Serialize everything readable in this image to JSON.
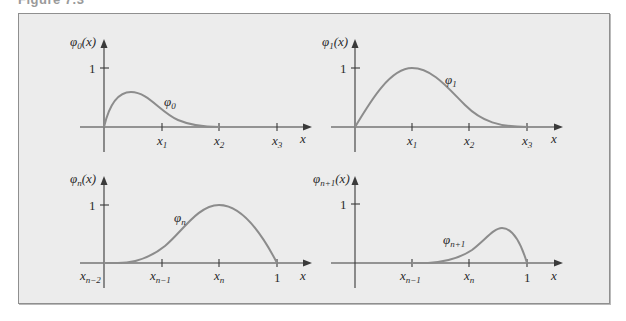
{
  "figure": {
    "caption_fragment": "Figure 7.3",
    "background": "#ececec",
    "curve_color": "#8c8c8c",
    "axis_color": "#3a3a3a"
  },
  "panels": [
    {
      "id": "phi0",
      "ylabel": "φ",
      "ylabel_sub": "0",
      "ylabel_arg": "(x)",
      "y_tick": "1",
      "curve_label": "φ",
      "curve_label_sub": "0",
      "xlabel": "x",
      "x_ticks": [
        {
          "base": "x",
          "sub": "1"
        },
        {
          "base": "x",
          "sub": "2"
        },
        {
          "base": "x",
          "sub": "3"
        }
      ],
      "origin_label": null
    },
    {
      "id": "phi1",
      "ylabel": "φ",
      "ylabel_sub": "1",
      "ylabel_arg": "(x)",
      "y_tick": "1",
      "curve_label": "φ",
      "curve_label_sub": "1",
      "xlabel": "x",
      "x_ticks": [
        {
          "base": "x",
          "sub": "1"
        },
        {
          "base": "x",
          "sub": "2"
        },
        {
          "base": "x",
          "sub": "3"
        }
      ],
      "origin_label": null
    },
    {
      "id": "phin",
      "ylabel": "φ",
      "ylabel_sub": "n",
      "ylabel_arg": "(x)",
      "y_tick": "1",
      "curve_label": "φ",
      "curve_label_sub": "n",
      "xlabel": "x",
      "x_ticks": [
        {
          "base": "x",
          "sub": "n−1"
        },
        {
          "base": "x",
          "sub": "n"
        },
        {
          "base": "1",
          "sub": ""
        }
      ],
      "origin_label": {
        "base": "x",
        "sub": "n−2"
      }
    },
    {
      "id": "phin1",
      "ylabel": "φ",
      "ylabel_sub": "n+1",
      "ylabel_arg": "(x)",
      "y_tick": "1",
      "curve_label": "φ",
      "curve_label_sub": "n+1",
      "xlabel": "x",
      "x_ticks": [
        {
          "base": "x",
          "sub": "n−1"
        },
        {
          "base": "x",
          "sub": "n"
        },
        {
          "base": "1",
          "sub": ""
        }
      ],
      "origin_label": null
    }
  ]
}
